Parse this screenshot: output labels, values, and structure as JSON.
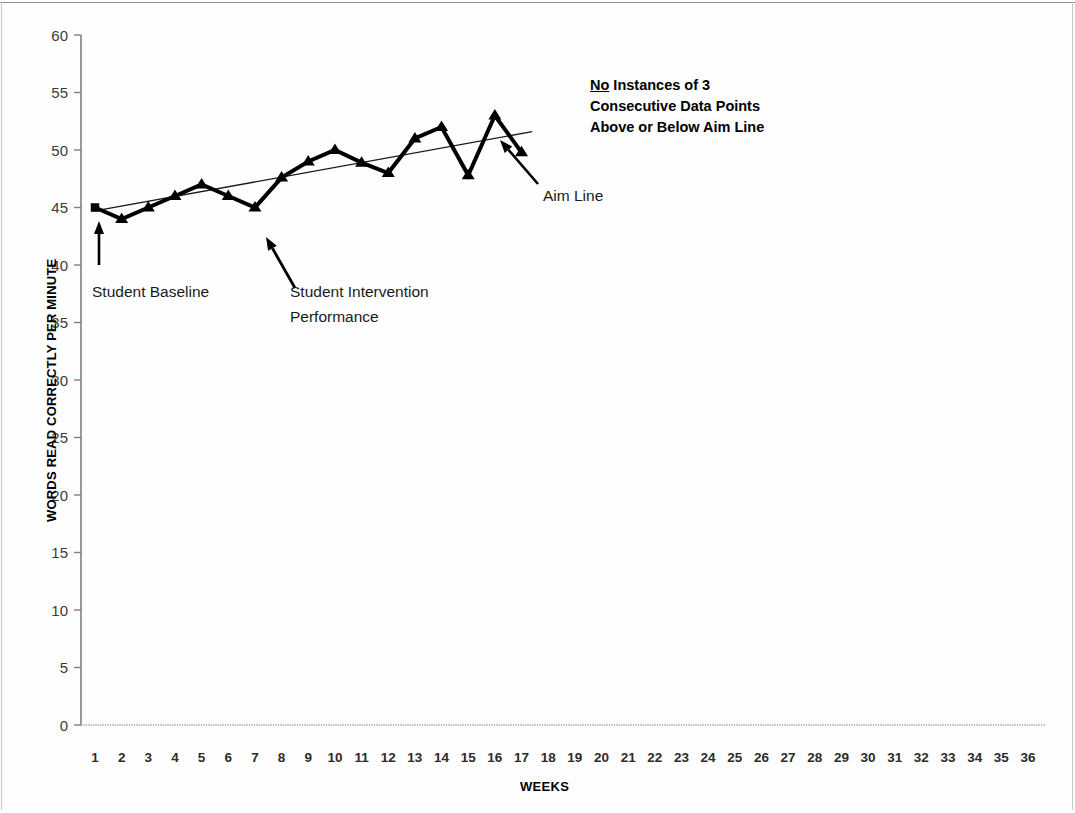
{
  "chart_data": {
    "type": "line",
    "title": "",
    "xlabel": "WEEKS",
    "ylabel": "WORDS READ CORRECTLY PER MINUTE",
    "xlim": [
      1,
      36
    ],
    "ylim": [
      0,
      60
    ],
    "ytick_step": 5,
    "grid": false,
    "legend_position": "none",
    "x": [
      1,
      2,
      3,
      4,
      5,
      6,
      7,
      8,
      9,
      10,
      11,
      12,
      13,
      14,
      15,
      16,
      17,
      18,
      19,
      20,
      21,
      22,
      23,
      24,
      25,
      26,
      27,
      28,
      29,
      30,
      31,
      32,
      33,
      34,
      35,
      36
    ],
    "xtick_labels": [
      "1",
      "2",
      "3",
      "4",
      "5",
      "6",
      "7",
      "8",
      "9",
      "10",
      "11",
      "12",
      "13",
      "14",
      "15",
      "16",
      "17",
      "18",
      "19",
      "20",
      "21",
      "22",
      "23",
      "24",
      "25",
      "26",
      "27",
      "28",
      "29",
      "30",
      "31",
      "32",
      "33",
      "34",
      "35",
      "36"
    ],
    "ytick_labels": [
      "0",
      "5",
      "10",
      "15",
      "20",
      "25",
      "30",
      "35",
      "40",
      "45",
      "50",
      "55",
      "60"
    ],
    "series": [
      {
        "name": "Student Baseline",
        "marker": "square",
        "points": [
          {
            "x": 1,
            "y": 45
          }
        ]
      },
      {
        "name": "Student Intervention Performance",
        "marker": "triangle",
        "points": [
          {
            "x": 2,
            "y": 44
          },
          {
            "x": 3,
            "y": 45
          },
          {
            "x": 4,
            "y": 46
          },
          {
            "x": 5,
            "y": 47
          },
          {
            "x": 6,
            "y": 46
          },
          {
            "x": 7,
            "y": 45
          },
          {
            "x": 8,
            "y": 47.6
          },
          {
            "x": 9,
            "y": 49
          },
          {
            "x": 10,
            "y": 50
          },
          {
            "x": 11,
            "y": 48.9
          },
          {
            "x": 12,
            "y": 48
          },
          {
            "x": 13,
            "y": 51
          },
          {
            "x": 14,
            "y": 52
          },
          {
            "x": 15,
            "y": 47.8
          },
          {
            "x": 16,
            "y": 53
          },
          {
            "x": 17,
            "y": 49.8
          }
        ]
      }
    ],
    "aim_line": {
      "name": "Aim Line",
      "start": {
        "x": 1,
        "y": 44.7
      },
      "end": {
        "x": 17.4,
        "y": 51.6
      }
    },
    "annotations": [
      {
        "name": "student-baseline",
        "text": "Student Baseline",
        "x": 1.2,
        "y": 38.5
      },
      {
        "name": "student-intervention-line1",
        "text": "Student Intervention",
        "x": 7.5,
        "y": 38.5
      },
      {
        "name": "student-intervention-line2",
        "text": "Performance",
        "x": 7.5,
        "y": 36.3
      },
      {
        "name": "aim-line-label",
        "text": "Aim Line",
        "x": 17.2,
        "y": 44.8
      }
    ],
    "callout": {
      "underlined_word": "No",
      "line1_rest": " Instances of 3",
      "line2": "Consecutive Data Points",
      "line3": "Above or Below Aim Line"
    },
    "colors": {
      "data_line": "#000000",
      "aim_line": "#1a1a1a",
      "axis": "#808080",
      "tick_label": "#3b3b3b",
      "background": "#ffffff"
    }
  }
}
